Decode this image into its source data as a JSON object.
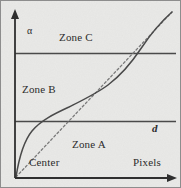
{
  "figure": {
    "width": 181,
    "height": 188,
    "background_color": "#e9e9e7",
    "ink_color": "#3a3a3a",
    "border_color": "#6e6e6e"
  },
  "axes": {
    "y_axis": {
      "label": "α",
      "name": "alpha",
      "x": 15,
      "top": 12,
      "bottom": 178,
      "arrow": "up"
    },
    "x_axis": {
      "label": "Pixels",
      "y": 178,
      "left": 15,
      "right": 176,
      "arrow": "right"
    },
    "origin_label": "Center"
  },
  "zone_dividers": [
    {
      "name": "upper-divider",
      "y": 53
    },
    {
      "name": "lower-divider",
      "y": 121,
      "label": "d"
    }
  ],
  "zones": [
    {
      "id": "C",
      "label": "Zone C",
      "x": 59,
      "y": 32
    },
    {
      "id": "B",
      "label": "Zone B",
      "x": 22,
      "y": 84
    },
    {
      "id": "A",
      "label": "Zone A",
      "x": 72,
      "y": 139
    }
  ],
  "chart_data": {
    "type": "line",
    "title": "",
    "xlabel": "Pixels",
    "ylabel": "α",
    "xlim": [
      0,
      181
    ],
    "ylim": [
      0,
      188
    ],
    "grid": false,
    "legend": null,
    "annotations": [
      {
        "text": "α",
        "x": 27,
        "y": 26
      },
      {
        "text": "Zone C",
        "x": 59,
        "y": 32
      },
      {
        "text": "Zone B",
        "x": 22,
        "y": 84
      },
      {
        "text": "Zone A",
        "x": 72,
        "y": 139
      },
      {
        "text": "d",
        "x": 152,
        "y": 123
      },
      {
        "text": "Center",
        "x": 29,
        "y": 157
      },
      {
        "text": "Pixels",
        "x": 133,
        "y": 157
      }
    ],
    "series": [
      {
        "name": "s-curve",
        "style": "solid",
        "color": "#4a4a4a",
        "path": "M16,177 C19,160 24,141 33,130 C42,119 56,113 70,106 C84,99 97,93 108,85 C120,76 131,64 141,49 C151,34 163,20 172,12"
      },
      {
        "name": "diagonal-reference",
        "style": "dashed",
        "color": "#7a7a7a",
        "path": "M16,177 L172,12"
      }
    ]
  }
}
